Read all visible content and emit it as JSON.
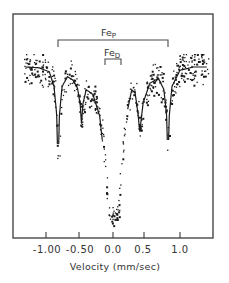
{
  "chart_data": {
    "type": "scatter",
    "title": "",
    "xlabel": "Velocity (mm/sec)",
    "ylabel": "",
    "xlim": [
      -1.35,
      1.5
    ],
    "x_ticks": [
      -1.0,
      -0.5,
      0.0,
      0.5,
      1.0
    ],
    "x_tick_labels": [
      "-1.00",
      "-0.50",
      "0.0",
      "0.5",
      "1.0"
    ],
    "grid": false,
    "legend": null,
    "annotations": [
      {
        "label": "Fe",
        "subscript": "P",
        "type": "bracket",
        "x_range": [
          -0.82,
          0.82
        ]
      },
      {
        "label": "Fe",
        "subscript": "D",
        "type": "bracket",
        "x_range": [
          -0.12,
          0.12
        ]
      }
    ],
    "series": [
      {
        "name": "fitted transmission (relative, baseline = 1.0)",
        "x": [
          -1.3,
          -1.1,
          -0.95,
          -0.88,
          -0.84,
          -0.82,
          -0.8,
          -0.76,
          -0.68,
          -0.6,
          -0.53,
          -0.49,
          -0.47,
          -0.45,
          -0.4,
          -0.3,
          -0.2,
          -0.12,
          -0.08,
          -0.04,
          0.0,
          0.04,
          0.08,
          0.12,
          0.2,
          0.28,
          0.33,
          0.37,
          0.4,
          0.45,
          0.55,
          0.68,
          0.76,
          0.8,
          0.82,
          0.84,
          0.88,
          1.0,
          1.2,
          1.4
        ],
        "y": [
          1.0,
          0.995,
          0.97,
          0.88,
          0.7,
          0.35,
          0.7,
          0.88,
          0.94,
          0.92,
          0.87,
          0.77,
          0.65,
          0.77,
          0.86,
          0.83,
          0.7,
          0.4,
          0.12,
          0.05,
          0.1,
          0.05,
          0.12,
          0.4,
          0.7,
          0.86,
          0.84,
          0.72,
          0.6,
          0.78,
          0.9,
          0.93,
          0.86,
          0.7,
          0.4,
          0.7,
          0.88,
          0.98,
          1.0,
          1.0
        ]
      }
    ],
    "peaks": [
      {
        "velocity": -0.82,
        "component": "Fe_P",
        "relative_depth": 0.65
      },
      {
        "velocity": -0.47,
        "component": "Fe_P",
        "relative_depth": 0.35
      },
      {
        "velocity": -0.06,
        "component": "Fe_D",
        "relative_depth": 0.95
      },
      {
        "velocity": 0.06,
        "component": "Fe_D",
        "relative_depth": 0.95
      },
      {
        "velocity": 0.4,
        "component": "Fe_P",
        "relative_depth": 0.4
      },
      {
        "velocity": 0.82,
        "component": "Fe_P",
        "relative_depth": 0.6
      }
    ]
  },
  "axis": {
    "tick_labels": [
      "-1.00",
      "-0.50",
      "0.0",
      "0.5",
      "1.0"
    ],
    "xlabel": "Velocity (mm/sec)"
  },
  "annotations": {
    "fe_p": {
      "main": "Fe",
      "sub": "P"
    },
    "fe_d": {
      "main": "Fe",
      "sub": "D"
    }
  }
}
